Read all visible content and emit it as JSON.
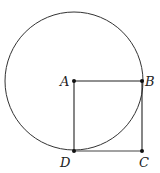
{
  "diagram": {
    "type": "geometry",
    "circle": {
      "center": "A",
      "cx": 74,
      "cy": 81,
      "r": 69
    },
    "points": [
      {
        "name": "A",
        "x": 74,
        "y": 81,
        "label_dx": -14,
        "label_dy": 4
      },
      {
        "name": "B",
        "x": 142,
        "y": 81,
        "label_dx": 4,
        "label_dy": 4
      },
      {
        "name": "C",
        "x": 142,
        "y": 151,
        "label_dx": -4,
        "label_dy": 18
      },
      {
        "name": "D",
        "x": 74,
        "y": 151,
        "label_dx": -14,
        "label_dy": 18
      }
    ],
    "segments": [
      [
        "A",
        "B"
      ],
      [
        "B",
        "C"
      ],
      [
        "C",
        "D"
      ],
      [
        "D",
        "A"
      ]
    ],
    "colors": {
      "stroke": "#222222",
      "circle": "#333333",
      "point": "#111111"
    }
  },
  "labels": {
    "A": "A",
    "B": "B",
    "C": "C",
    "D": "D"
  },
  "caption": "…(cut-off text line)"
}
